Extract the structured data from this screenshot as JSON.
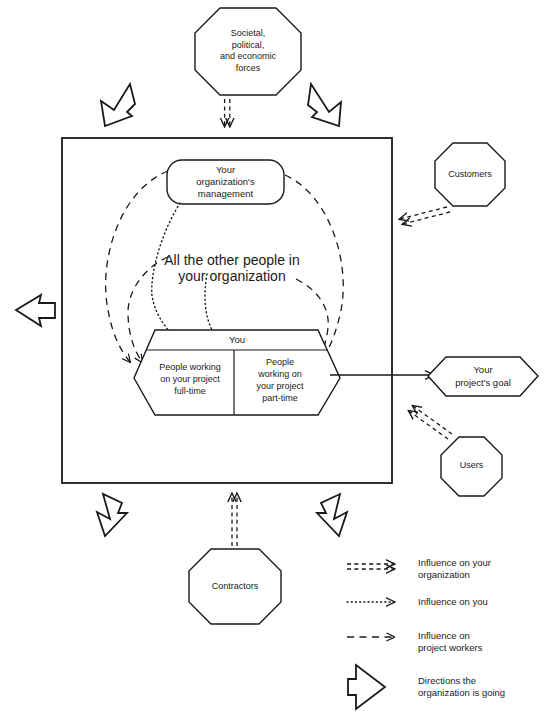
{
  "diagram": {
    "frame": {
      "name": "organization-boundary"
    },
    "nodes": {
      "societal": {
        "label_lines": [
          "Societal,",
          "political,",
          "and economic",
          "forces"
        ],
        "shape": "octagon"
      },
      "customers": {
        "label_lines": [
          "Customers"
        ],
        "shape": "octagon"
      },
      "users": {
        "label_lines": [
          "Users"
        ],
        "shape": "octagon"
      },
      "contractors": {
        "label_lines": [
          "Contractors"
        ],
        "shape": "octagon"
      },
      "management": {
        "label_lines": [
          "Your",
          "organization's",
          "management"
        ],
        "shape": "rounded-rect"
      },
      "other_people": {
        "label_lines": [
          "All the other people in",
          "your organization"
        ],
        "shape": "text-only"
      },
      "you": {
        "label_lines": [
          "You"
        ],
        "shape": "hexagon"
      },
      "full_time": {
        "label_lines": [
          "People working",
          "on your project",
          "full-time"
        ],
        "shape": "hexagon-cell"
      },
      "part_time": {
        "label_lines": [
          "People",
          "working on",
          "your project",
          "part-time"
        ],
        "shape": "hexagon-cell"
      },
      "goal": {
        "label_lines": [
          "Your",
          "project's goal"
        ],
        "shape": "hexagon"
      }
    },
    "legend": {
      "items": [
        {
          "marker": "double-dashed-arrow-icon",
          "label_lines": [
            "Influence on your",
            "organization"
          ]
        },
        {
          "marker": "dotted-arrow-icon",
          "label_lines": [
            "Influence on you"
          ]
        },
        {
          "marker": "dashed-arrow-icon",
          "label_lines": [
            "Influence on",
            "project workers"
          ]
        },
        {
          "marker": "fat-outline-arrow-icon",
          "label_lines": [
            "Directions the",
            "organization is going"
          ]
        }
      ]
    },
    "colors": {
      "stroke": "#1a1a1a",
      "fill": "#ffffff",
      "background": "#ffffff"
    }
  }
}
